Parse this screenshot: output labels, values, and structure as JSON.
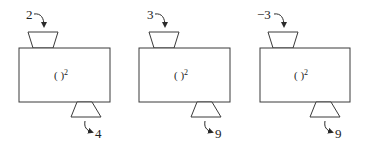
{
  "diagram": {
    "title": "",
    "machines": [
      {
        "input": "2",
        "function_label": "( )",
        "exponent": "2",
        "output": "4"
      },
      {
        "input": "3",
        "function_label": "( )",
        "exponent": "2",
        "output": "9"
      },
      {
        "input": "−3",
        "function_label": "( )",
        "exponent": "2",
        "output": "9"
      }
    ]
  },
  "colors": {
    "stroke": "#3a3a3a",
    "text": "#222222",
    "background": "#ffffff"
  }
}
